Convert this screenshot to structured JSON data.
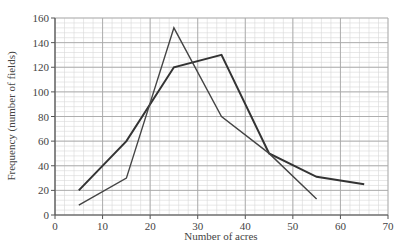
{
  "chart_data": {
    "type": "line",
    "title": "",
    "xlabel": "Number of acres",
    "ylabel": "Frequency (number of fields)",
    "xlim": [
      0,
      70
    ],
    "ylim": [
      0,
      160
    ],
    "x_ticks": [
      0,
      10,
      20,
      30,
      40,
      50,
      60,
      70
    ],
    "y_ticks": [
      0,
      20,
      40,
      60,
      80,
      100,
      120,
      140,
      160
    ],
    "grid": true,
    "legend": null,
    "series": [
      {
        "name": "Polygon A (thick)",
        "x": [
          5,
          15,
          25,
          35,
          45,
          55,
          65
        ],
        "values": [
          20,
          60,
          120,
          130,
          50,
          31,
          25
        ],
        "color": "#333333",
        "line_width": 2
      },
      {
        "name": "Polygon B (thin)",
        "x": [
          5,
          15,
          25,
          35,
          45,
          55
        ],
        "values": [
          8,
          30,
          152,
          80,
          50,
          13
        ],
        "color": "#444444",
        "line_width": 1.4
      }
    ]
  },
  "layout": {
    "plot_left": 55,
    "plot_right": 388,
    "plot_top": 18,
    "plot_bottom": 215,
    "minor_x_step": 2,
    "minor_y_step": 4,
    "major_x_step": 10,
    "major_y_step": 20,
    "colors": {
      "minor_grid": "#d6d6d6",
      "major_grid": "#a8a8a8",
      "axis": "#555555"
    }
  }
}
